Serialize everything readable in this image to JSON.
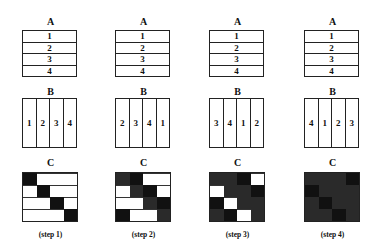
{
  "diagram": {
    "labels": {
      "a": "A",
      "b": "B",
      "c": "C"
    },
    "columns": [
      {
        "step_label": "(step 1)",
        "a_rows": [
          "1",
          "2",
          "3",
          "4"
        ],
        "b_cells": [
          "1",
          "2",
          "3",
          "4"
        ],
        "c_grid": [
          [
            "black",
            "white",
            "white",
            "white"
          ],
          [
            "white",
            "black",
            "white",
            "white"
          ],
          [
            "white",
            "white",
            "black",
            "white"
          ],
          [
            "white",
            "white",
            "white",
            "black"
          ]
        ]
      },
      {
        "step_label": "(step 2)",
        "a_rows": [
          "1",
          "2",
          "3",
          "4"
        ],
        "b_cells": [
          "2",
          "3",
          "4",
          "1"
        ],
        "c_grid": [
          [
            "dotted",
            "black",
            "white",
            "white"
          ],
          [
            "white",
            "dotted",
            "black",
            "white"
          ],
          [
            "white",
            "white",
            "dotted",
            "black"
          ],
          [
            "black",
            "white",
            "white",
            "dotted"
          ]
        ]
      },
      {
        "step_label": "(step 3)",
        "a_rows": [
          "1",
          "2",
          "3",
          "4"
        ],
        "b_cells": [
          "3",
          "4",
          "1",
          "2"
        ],
        "c_grid": [
          [
            "dotted",
            "dotted",
            "black",
            "white"
          ],
          [
            "white",
            "dotted",
            "dotted",
            "black"
          ],
          [
            "black",
            "white",
            "dotted",
            "dotted"
          ],
          [
            "dotted",
            "black",
            "white",
            "dotted"
          ]
        ]
      },
      {
        "step_label": "(step 4)",
        "a_rows": [
          "1",
          "2",
          "3",
          "4"
        ],
        "b_cells": [
          "4",
          "1",
          "2",
          "3"
        ],
        "c_grid": [
          [
            "dotted",
            "dotted",
            "dotted",
            "black"
          ],
          [
            "black",
            "dotted",
            "dotted",
            "dotted"
          ],
          [
            "dotted",
            "black",
            "dotted",
            "dotted"
          ],
          [
            "dotted",
            "dotted",
            "black",
            "dotted"
          ]
        ]
      }
    ],
    "colors": {
      "black": "#111111",
      "dotted": "#2a2a2a",
      "white": "#ffffff",
      "line": "#222222"
    }
  }
}
